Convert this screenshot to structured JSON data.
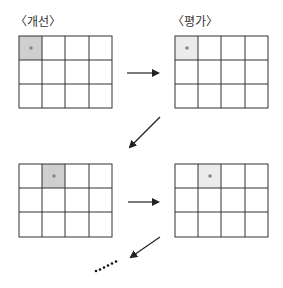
{
  "labels": {
    "improve": "〈개선〉",
    "evaluate": "〈평가〉"
  },
  "top_partial_text": "",
  "grids": [
    {
      "name": "improve-grid-1",
      "rows": 3,
      "cols": 4,
      "highlight": {
        "row": 0,
        "col": 0,
        "fill": "#cfcfcf"
      }
    },
    {
      "name": "evaluate-grid-1",
      "rows": 3,
      "cols": 4,
      "highlight": {
        "row": 0,
        "col": 0,
        "fill": "#ececec"
      }
    },
    {
      "name": "improve-grid-2",
      "rows": 3,
      "cols": 4,
      "highlight": {
        "row": 0,
        "col": 1,
        "fill": "#cfcfcf"
      }
    },
    {
      "name": "evaluate-grid-2",
      "rows": 3,
      "cols": 4,
      "highlight": {
        "row": 0,
        "col": 1,
        "fill": "#ececec"
      }
    }
  ],
  "continuation": "……"
}
